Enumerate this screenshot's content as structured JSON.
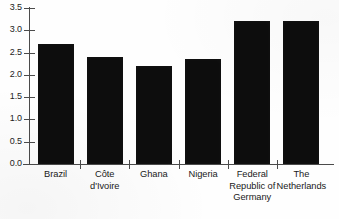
{
  "chart_data": {
    "type": "bar",
    "title": "",
    "xlabel": "",
    "ylabel": "",
    "categories": [
      "Brazil",
      "Côte d'Ivoire",
      "Ghana",
      "Nigeria",
      "Federal Republic of Germany",
      "The Netherlands"
    ],
    "category_lines": [
      [
        "Brazil"
      ],
      [
        "Côte",
        "d'Ivoire"
      ],
      [
        "Ghana"
      ],
      [
        "Nigeria"
      ],
      [
        "Federal",
        "Republic of",
        "Germany"
      ],
      [
        "The",
        "Netherlands"
      ]
    ],
    "values": [
      2.7,
      2.4,
      2.2,
      2.35,
      3.2,
      3.2
    ],
    "ylim": [
      0.0,
      3.5
    ],
    "ytick_step": 0.5,
    "ytick_labels": [
      "0.0",
      "0.5",
      "1.0",
      "1.5",
      "2.0",
      "2.5",
      "3.0",
      "3.5"
    ],
    "ytick_values": [
      0.0,
      0.5,
      1.0,
      1.5,
      2.0,
      2.5,
      3.0,
      3.5
    ],
    "grid": false,
    "legend": null,
    "bar_color": "#0d0d0d",
    "axis_color": "#4b4b4b",
    "background_color": "#fefefe"
  }
}
